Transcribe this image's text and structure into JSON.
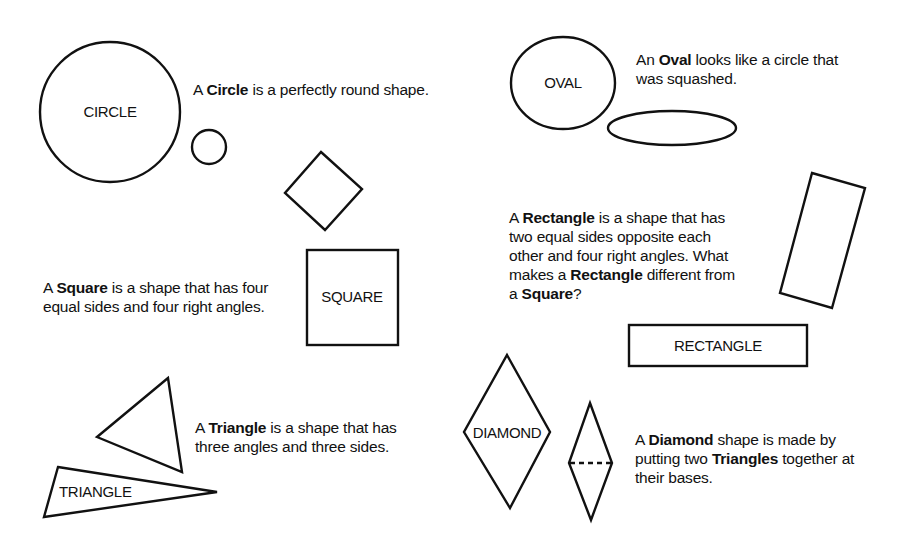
{
  "colors": {
    "ink": "#111111",
    "background": "#ffffff"
  },
  "shapes": {
    "circle": {
      "label": "CIRCLE"
    },
    "oval": {
      "label": "OVAL"
    },
    "square": {
      "label": "SQUARE"
    },
    "rectangle": {
      "label": "RECTANGLE"
    },
    "triangle": {
      "label": "TRIANGLE"
    },
    "diamond": {
      "label": "DIAMOND"
    }
  },
  "descriptions": {
    "circle": {
      "pre": "A ",
      "term": "Circle",
      "post": " is a perfectly round shape."
    },
    "oval": {
      "line1_pre": "An ",
      "line1_term": "Oval",
      "line1_post": " looks like a circle that",
      "line2": "was squashed."
    },
    "rectangle": {
      "line1_pre": "A ",
      "line1_term": "Rectangle",
      "line1_post": " is a shape that has",
      "line2": "two equal sides opposite each",
      "line3": "other and four right angles. What",
      "line4_pre": "makes a ",
      "line4_term": "Rectangle",
      "line4_post": " different from",
      "line5_pre": "a ",
      "line5_term": "Square",
      "line5_post": "?"
    },
    "square": {
      "line1_pre": "A ",
      "line1_term": "Square",
      "line1_post": " is a shape that has four",
      "line2": "equal sides and four right angles."
    },
    "triangle": {
      "line1_pre": "A ",
      "line1_term": "Triangle",
      "line1_post": " is a shape that has",
      "line2": "three angles and three sides."
    },
    "diamond": {
      "line1_pre": "A ",
      "line1_term": "Diamond",
      "line1_post": " shape is made by",
      "line2_pre": "putting two ",
      "line2_term": "Triangles",
      "line2_post": " together at",
      "line3": "their bases."
    }
  }
}
